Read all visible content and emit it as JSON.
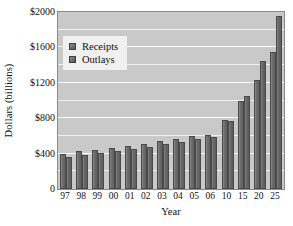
{
  "chart_data": {
    "type": "bar",
    "title": "",
    "xlabel": "Year",
    "ylabel": "Dollars (billions)",
    "ylim": [
      0,
      2000
    ],
    "ytick_values": [
      0,
      400,
      800,
      1200,
      1600,
      2000
    ],
    "ytick_labels": [
      "0",
      "$400",
      "$800",
      "$1200",
      "$1600",
      "$2000"
    ],
    "grid": true,
    "grid_axis": "y",
    "legend_position": "upper-left-inside",
    "categories": [
      "97",
      "98",
      "99",
      "00",
      "01",
      "02",
      "03",
      "04",
      "05",
      "06",
      "10",
      "15",
      "20",
      "25"
    ],
    "series": [
      {
        "name": "Receipts",
        "color": "#6e6e6e",
        "values": [
          400,
          425,
          437,
          460,
          485,
          510,
          540,
          570,
          595,
          615,
          775,
          995,
          1235,
          1545
        ]
      },
      {
        "name": "Outlays",
        "color": "#6e6e6e",
        "values": [
          362,
          388,
          412,
          425,
          455,
          478,
          505,
          530,
          560,
          588,
          765,
          1055,
          1450,
          1960
        ]
      }
    ]
  },
  "legend": {
    "items": [
      {
        "label": "Receipts",
        "swatch": "legend-swatch-receipts"
      },
      {
        "label": "Outlays",
        "swatch": "legend-swatch-outlays"
      }
    ]
  },
  "axes": {
    "y_title": "Dollars (billions)",
    "x_title": "Year"
  }
}
